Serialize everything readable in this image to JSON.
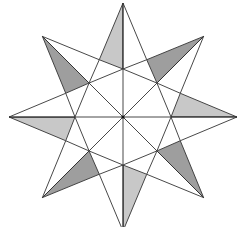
{
  "diagram": {
    "title": "",
    "type": "eight-pointed star",
    "center": [
      123,
      117
    ],
    "points": 8,
    "tip_radius": 114,
    "shoulder_radius": 62,
    "octagon_radius": 48,
    "start_angle_deg": -90,
    "colors": {
      "background": "#ffffff",
      "stroke": "#333333",
      "cardinal_shade": "#c8c8c8",
      "diagonal_shade": "#9e9e9e",
      "fill": "#ffffff"
    },
    "shaded_side": "counterclockwise"
  }
}
